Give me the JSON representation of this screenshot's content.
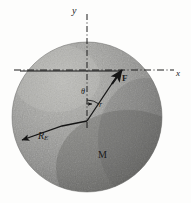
{
  "figure": {
    "kind": "physics-diagram",
    "labels": {
      "y_axis": "y",
      "x_axis": "x",
      "force_vector": "F",
      "angle": "θ",
      "radius_vector": "r",
      "earth_radius": "R",
      "earth_radius_sub": "E",
      "mass": "M"
    },
    "colors": {
      "sphere_light": "#a6a6a3",
      "sphere_mid": "#909090",
      "sphere_dark": "#5f5f5f",
      "ink": "#1a1a1a",
      "background": "#fdfdfc"
    },
    "geometry": {
      "sphere_center_x": 87,
      "sphere_center_y": 117,
      "sphere_radius": 75,
      "axis_origin_x": 87,
      "axis_y_line_y": 70,
      "force_tip_x": 122,
      "force_tip_y": 70,
      "theta_degrees": 36
    }
  }
}
